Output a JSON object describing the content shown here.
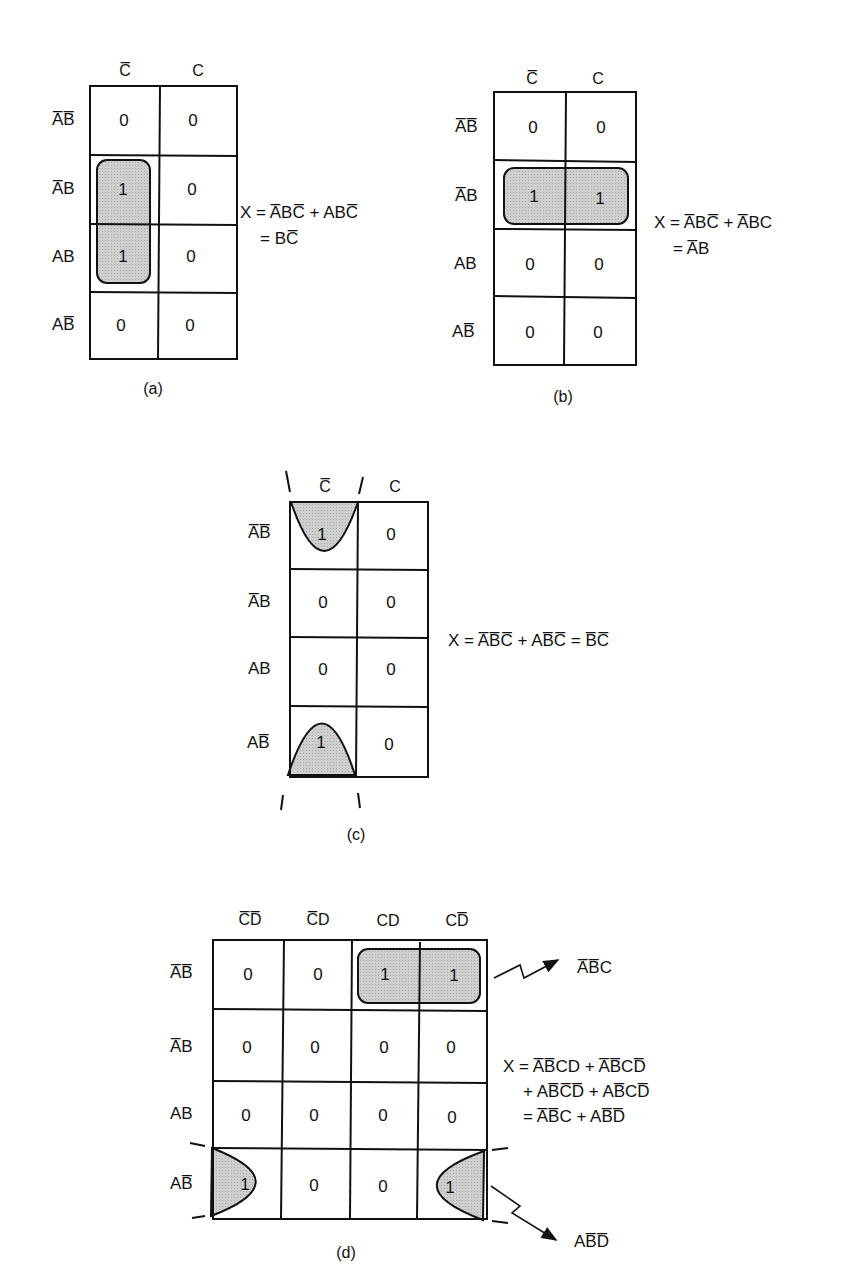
{
  "figure": {
    "panels": [
      {
        "id": "a",
        "caption": "(a)",
        "columns": [
          "C̅",
          "C"
        ],
        "rows": [
          "A̅B̅",
          "A̅B",
          "AB",
          "AB̅"
        ],
        "cells": [
          [
            "0",
            "0"
          ],
          [
            "1",
            "0"
          ],
          [
            "1",
            "0"
          ],
          [
            "0",
            "0"
          ]
        ],
        "grouping": "vertical pair in C̅ column, rows A̅B and AB",
        "equation": [
          "X = A̅BC̅ + ABC̅",
          "= BC̅"
        ]
      },
      {
        "id": "b",
        "caption": "(b)",
        "columns": [
          "C̅",
          "C"
        ],
        "rows": [
          "A̅B̅",
          "A̅B",
          "AB",
          "AB̅"
        ],
        "cells": [
          [
            "0",
            "0"
          ],
          [
            "1",
            "1"
          ],
          [
            "0",
            "0"
          ],
          [
            "0",
            "0"
          ]
        ],
        "grouping": "horizontal pair in row A̅B",
        "equation": [
          "X = A̅BC̅ + A̅BC",
          "= A̅B"
        ]
      },
      {
        "id": "c",
        "caption": "(c)",
        "columns": [
          "C̅",
          "C"
        ],
        "rows": [
          "A̅B̅",
          "A̅B",
          "AB",
          "AB̅"
        ],
        "cells": [
          [
            "1",
            "0"
          ],
          [
            "0",
            "0"
          ],
          [
            "0",
            "0"
          ],
          [
            "1",
            "0"
          ]
        ],
        "grouping": "wrap-around pair in C̅ column, top and bottom rows",
        "equation": [
          "X = A̅B̅C̅ + AB̅C̅ = B̅C̅"
        ]
      },
      {
        "id": "d",
        "caption": "(d)",
        "columns": [
          "C̅D̅",
          "C̅D",
          "CD",
          "CD̅"
        ],
        "rows": [
          "A̅B̅",
          "A̅B",
          "AB",
          "AB̅"
        ],
        "cells": [
          [
            "0",
            "0",
            "1",
            "1"
          ],
          [
            "0",
            "0",
            "0",
            "0"
          ],
          [
            "0",
            "0",
            "0",
            "0"
          ],
          [
            "1",
            "0",
            "0",
            "1"
          ]
        ],
        "grouping": "pair in row A̅B̅ (CD, CD̅); wrap-around pair in row AB̅ (C̅D̅, CD̅)",
        "equation": [
          "X = A̅B̅CD + A̅B̅CD̅",
          "+ AB̅C̅D̅ + AB̅CD̅",
          "= A̅B̅C    + AB̅D̅"
        ],
        "annotations": [
          "A̅B̅C",
          "AB̅D̅"
        ]
      }
    ]
  }
}
